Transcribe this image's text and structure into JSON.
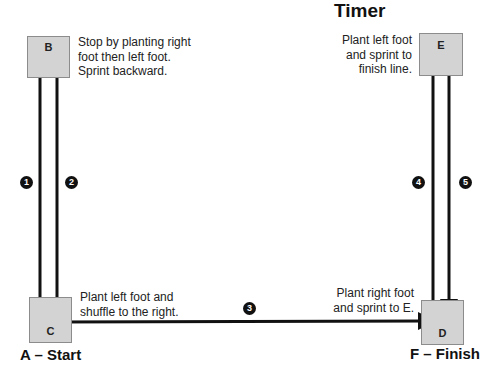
{
  "title": "Timer",
  "stations": {
    "B": {
      "letter": "B"
    },
    "C": {
      "letter": "C"
    },
    "D": {
      "letter": "D"
    },
    "E": {
      "letter": "E"
    }
  },
  "labels": {
    "start": "A – Start",
    "finish": "F – Finish"
  },
  "notes": {
    "B": [
      "Stop by planting right",
      "foot then left foot.",
      "Sprint backward."
    ],
    "C": [
      "Plant left foot and",
      "shuffle to the right."
    ],
    "D": [
      "Plant right foot",
      "and sprint to E."
    ],
    "E": [
      "Plant left foot",
      "and sprint to",
      "finish line."
    ]
  },
  "steps": [
    "1",
    "2",
    "3",
    "4",
    "5"
  ],
  "colors": {
    "station_fill": "#d3d3d3",
    "arrow": "#111111"
  }
}
